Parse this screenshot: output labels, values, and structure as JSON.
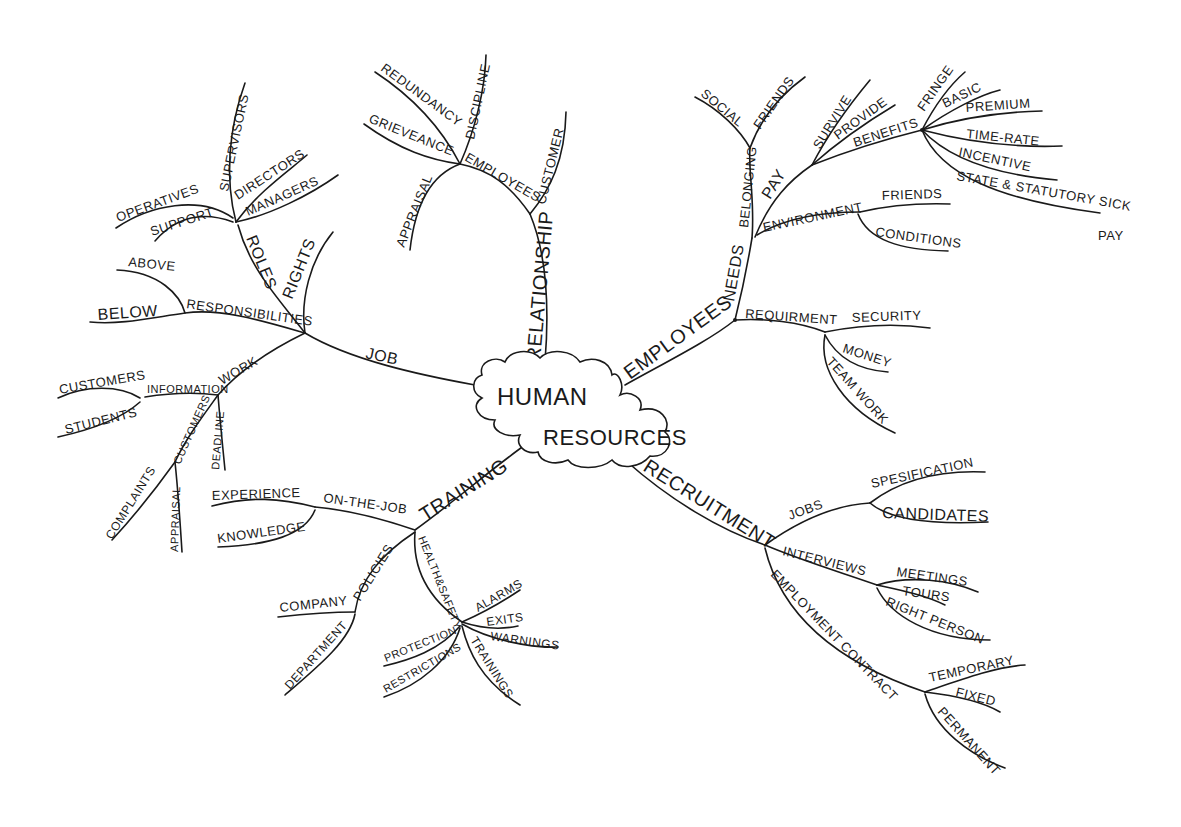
{
  "center": {
    "line1": "HUMAN",
    "line2": "RESOURCES"
  },
  "branches": {
    "job": {
      "label": "JOB",
      "roles": {
        "label": "ROLES",
        "children": [
          "SUPERVISORS",
          "DIRECTORS",
          "MANAGERS",
          "OPERATIVES",
          "SUPPORT"
        ]
      },
      "rights": "RIGHTS",
      "responsibilities": {
        "label": "RESPONSIBILITIES",
        "children": [
          "ABOVE",
          "BELOW"
        ]
      },
      "work": {
        "label": "WORK",
        "information": {
          "label": "INFORMATION",
          "children": [
            "CUSTOMERS",
            "STUDENTS"
          ]
        },
        "customers": {
          "label": "CUSTOMERS",
          "children": [
            "COMPLAINTS",
            "APPRAISAL"
          ]
        },
        "deadline": "DEADLINE"
      }
    },
    "relationship": {
      "label": "RELATIONSHIP",
      "customer": "CUSTOMER",
      "employees": {
        "label": "EMPLOYEES",
        "children": [
          "REDUNDANCY",
          "DISCIPLINE",
          "GRIEVEANCE",
          "APPRAISAL"
        ]
      }
    },
    "employees": {
      "label": "EMPLOYEES",
      "needs": {
        "label": "NEEDS",
        "belonging": {
          "label": "BELONGING",
          "children": [
            "SOCIAL",
            "FRIENDS"
          ]
        },
        "pay": {
          "label": "PAY",
          "children": [
            "SURVIVE",
            "PROVIDE"
          ],
          "benefits": {
            "label": "BENEFITS",
            "children": [
              "FRINGE",
              "BASIC",
              "PREMIUM",
              "TIME-RATE",
              "INCENTIVE",
              "STATE & STATUTORY SICK",
              "PAY"
            ]
          }
        },
        "environment": {
          "label": "ENVIRONMENT",
          "children": [
            "FRIENDS",
            "CONDITIONS"
          ]
        }
      },
      "requirment": {
        "label": "REQUIRMENT",
        "children": [
          "SECURITY",
          "MONEY",
          "TEAM WORK"
        ]
      }
    },
    "training": {
      "label": "TRAINING",
      "on_the_job": {
        "label": "ON-THE-JOB",
        "children": [
          "EXPERIENCE",
          "KNOWLEDGE"
        ]
      },
      "policies": {
        "label": "POLICIES",
        "children": [
          "COMPANY",
          "DEPARTMENT"
        ]
      },
      "health_safety": {
        "label": "HEALTH&SAFETY",
        "children": [
          "ALARMS",
          "EXITS",
          "WARNINGS",
          "TRAININGS",
          "PROTECTION",
          "RESTRICTIONS"
        ]
      }
    },
    "recruitment": {
      "label": "RECRUITMENT",
      "jobs": {
        "label": "JOBS",
        "children": [
          "SPESIFICATION",
          "CANDIDATES"
        ]
      },
      "interviews": {
        "label": "INTERVIEWS",
        "children": [
          "MEETINGS",
          "TOURS",
          "RIGHT PERSON"
        ]
      },
      "employment_contract": {
        "label": "EMPLOYMENT CONTRACT",
        "children": [
          "TEMPORARY",
          "FIXED",
          "PERMANENT"
        ]
      }
    }
  },
  "colors": {
    "ink": "#1a1a1a",
    "paper": "#ffffff"
  }
}
